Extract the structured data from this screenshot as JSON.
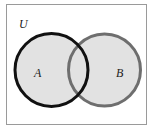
{
  "diagram": {
    "type": "venn",
    "universe": {
      "label": "U"
    },
    "sets": [
      {
        "label": "A",
        "stroke": "#111111"
      },
      {
        "label": "B",
        "stroke": "#6e6e6e"
      }
    ],
    "colors": {
      "background": "#ffffff",
      "border": "#9a9a9a",
      "fill": "#e2e2e2"
    }
  }
}
